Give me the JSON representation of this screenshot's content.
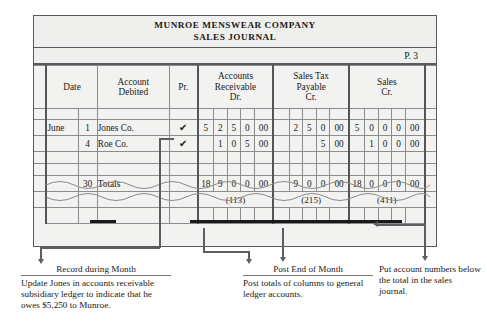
{
  "document": {
    "company": "MUNROE MENSWEAR COMPANY",
    "journal_name": "SALES JOURNAL",
    "page_ref": "P. 3"
  },
  "table": {
    "headers": {
      "date": "Date",
      "account_debited_l1": "Account",
      "account_debited_l2": "Debited",
      "pr": "Pr.",
      "ar_l1": "Accounts",
      "ar_l2": "Receivable",
      "ar_l3": "Dr.",
      "stp_l1": "Sales Tax",
      "stp_l2": "Payable",
      "stp_l3": "Cr.",
      "sales_l1": "Sales",
      "sales_l2": "Cr."
    },
    "rows": [
      {
        "month": "June",
        "day": "1",
        "account": "Jones Co.",
        "pr": "✔",
        "ar": [
          "5",
          "2",
          "5",
          "0",
          "00"
        ],
        "stp": [
          "",
          "2",
          "5",
          "0",
          "00"
        ],
        "sales": [
          "5",
          "0",
          "0",
          "0",
          "00"
        ]
      },
      {
        "month": "",
        "day": "4",
        "account": "Roe Co.",
        "pr": "✔",
        "ar": [
          "",
          "1",
          "0",
          "5",
          "00"
        ],
        "stp": [
          "",
          "",
          "",
          "5",
          "00"
        ],
        "sales": [
          "",
          "1",
          "0",
          "0",
          "00"
        ]
      }
    ],
    "totals_row": {
      "month": "",
      "day": "30",
      "account": "Totals",
      "pr": "",
      "ar": [
        "18",
        "9",
        "0",
        "0",
        "00"
      ],
      "stp": [
        "",
        "9",
        "0",
        "0",
        "00"
      ],
      "sales": [
        "18",
        "0",
        "0",
        "0",
        "00"
      ]
    },
    "account_numbers": {
      "ar": "(113)",
      "stp": "(215)",
      "sales": "(411)"
    }
  },
  "annotations": [
    {
      "heading": "Record during Month",
      "body": "Update Jones in accounts receivable subsidiary ledger to indicate that he owes $5,250 to Munroe."
    },
    {
      "heading": "Post End of Month",
      "body": "Post totals of columns to general ledger accounts."
    },
    {
      "heading": "",
      "body": "Put account numbers below the total in the sales journal."
    }
  ]
}
